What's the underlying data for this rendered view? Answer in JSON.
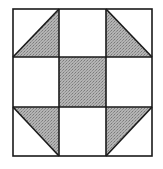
{
  "diagram": {
    "type": "quilt-block",
    "pattern": "shoo-fly",
    "grid": {
      "rows": 3,
      "cols": 3
    },
    "colors": {
      "background": "#ffffff",
      "line": "#1a1a1a",
      "fill": "#a9a9a9"
    },
    "cells": [
      {
        "row": 0,
        "col": 0,
        "kind": "half-square-triangle",
        "shaded": "bottom-right"
      },
      {
        "row": 0,
        "col": 1,
        "kind": "plain",
        "shaded": "none"
      },
      {
        "row": 0,
        "col": 2,
        "kind": "half-square-triangle",
        "shaded": "bottom-left"
      },
      {
        "row": 1,
        "col": 0,
        "kind": "plain",
        "shaded": "none"
      },
      {
        "row": 1,
        "col": 1,
        "kind": "plain",
        "shaded": "full"
      },
      {
        "row": 1,
        "col": 2,
        "kind": "plain",
        "shaded": "none"
      },
      {
        "row": 2,
        "col": 0,
        "kind": "half-square-triangle",
        "shaded": "top-right"
      },
      {
        "row": 2,
        "col": 1,
        "kind": "plain",
        "shaded": "none"
      },
      {
        "row": 2,
        "col": 2,
        "kind": "half-square-triangle",
        "shaded": "top-left"
      }
    ]
  }
}
